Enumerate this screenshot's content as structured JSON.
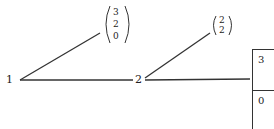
{
  "diagram": {
    "nodes": [
      {
        "id": "1",
        "label": "1"
      },
      {
        "id": "2",
        "label": "2"
      }
    ],
    "vectors": [
      {
        "id": "v1",
        "entries": [
          "3",
          "2",
          "0"
        ],
        "attached_to": "1"
      },
      {
        "id": "v2",
        "entries": [
          "2",
          "2"
        ],
        "attached_to": "2"
      }
    ],
    "edges": [
      {
        "from": "1",
        "to": "v1"
      },
      {
        "from": "1",
        "to": "2"
      },
      {
        "from": "2",
        "to": "v2"
      },
      {
        "from": "2",
        "to": "table"
      }
    ],
    "table": {
      "cells": [
        "3",
        "0"
      ]
    },
    "colors": {
      "line": "#333333",
      "text": "#222222",
      "background": "#ffffff"
    }
  }
}
